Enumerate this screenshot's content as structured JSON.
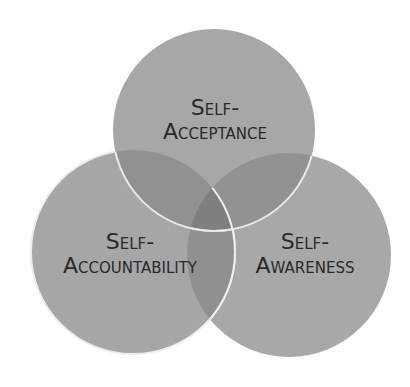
{
  "diagram": {
    "type": "venn",
    "background": "#ffffff",
    "fill_color": "#8c8c8c",
    "stroke_color": "#ffffff",
    "circles": [
      {
        "id": "acceptance",
        "line1": "Self-",
        "line2": "Acceptance"
      },
      {
        "id": "accountability",
        "line1": "Self-",
        "line2": "Accountability"
      },
      {
        "id": "awareness",
        "line1": "Self-",
        "line2": "Awareness"
      }
    ]
  }
}
